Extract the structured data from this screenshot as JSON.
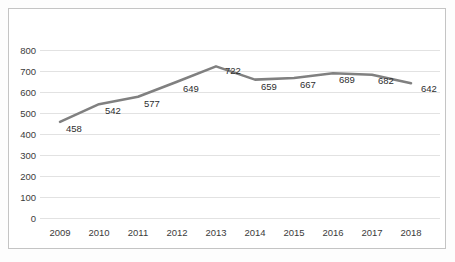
{
  "chart_data": {
    "type": "line",
    "title": "",
    "subtitle": "",
    "xlabel": "",
    "ylabel": "",
    "categories": [
      "2009",
      "2010",
      "2011",
      "2012",
      "2013",
      "2014",
      "2015",
      "2016",
      "2017",
      "2018"
    ],
    "values": [
      458,
      542,
      577,
      649,
      722,
      659,
      667,
      689,
      682,
      642
    ],
    "series": [
      {
        "name": "",
        "values": [
          458,
          542,
          577,
          649,
          722,
          659,
          667,
          689,
          682,
          642
        ]
      }
    ],
    "data_labels": [
      "458",
      "542",
      "577",
      "649",
      "722",
      "659",
      "667",
      "689",
      "682",
      "642"
    ],
    "ylim": [
      0,
      800
    ],
    "ytick_step": 100,
    "yticks": [
      "800",
      "700",
      "600",
      "500",
      "400",
      "300",
      "200",
      "100",
      "0"
    ],
    "xticks": [
      "2009",
      "2010",
      "2011",
      "2012",
      "2013",
      "2014",
      "2015",
      "2016",
      "2017",
      "2018"
    ],
    "grid": true,
    "grid_axis": "y",
    "legend": false,
    "legend_position": "none",
    "markers": false,
    "colors": {
      "line": "#808080",
      "grid": "#e2e2e2",
      "frame": "#c4c4c4",
      "text": "#3b3b3b",
      "label_text": "#2e2e2e",
      "background": "#ffffff"
    }
  }
}
